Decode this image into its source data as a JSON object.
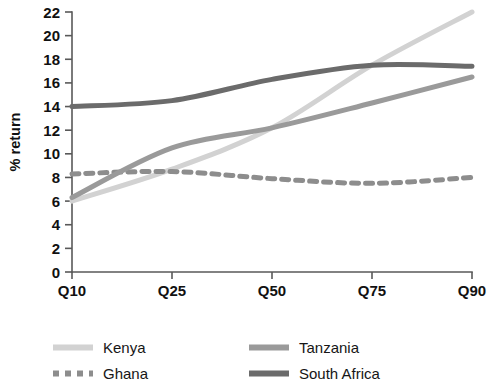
{
  "chart_data": {
    "type": "line",
    "title": "",
    "xlabel": "Quantile",
    "ylabel": "% return",
    "categories": [
      "Q10",
      "Q25",
      "Q50",
      "Q75",
      "Q90"
    ],
    "ylim": [
      0,
      22
    ],
    "yticks": [
      0,
      2,
      4,
      6,
      8,
      10,
      12,
      14,
      16,
      18,
      20,
      22
    ],
    "ytick_labels": [
      "0",
      "2",
      "4",
      "6",
      "8",
      "10",
      "12",
      "14",
      "16",
      "18",
      "20",
      "22"
    ],
    "grid": false,
    "legend_position": "bottom",
    "series": [
      {
        "name": "Kenya",
        "values": [
          6.0,
          8.7,
          12.2,
          17.5,
          22.0
        ],
        "color": "#d2d2d2",
        "style": "solid",
        "width": 5
      },
      {
        "name": "Ghana",
        "values": [
          8.3,
          8.5,
          7.9,
          7.5,
          8.0
        ],
        "color": "#8d8d8d",
        "style": "dashed",
        "width": 5
      },
      {
        "name": "Tanzania",
        "values": [
          6.3,
          10.5,
          12.2,
          14.3,
          16.5
        ],
        "color": "#9a9a9a",
        "style": "solid",
        "width": 5
      },
      {
        "name": "South Africa",
        "values": [
          14.0,
          14.5,
          16.3,
          17.5,
          17.4
        ],
        "color": "#6b6b6b",
        "style": "solid",
        "width": 5
      }
    ]
  },
  "legend": {
    "items": [
      {
        "label": "Kenya"
      },
      {
        "label": "Tanzania"
      },
      {
        "label": "Ghana"
      },
      {
        "label": "South Africa"
      }
    ]
  }
}
